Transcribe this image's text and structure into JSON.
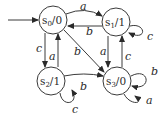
{
  "diagram": {
    "type": "finite-state-machine",
    "start_state": "s0",
    "states": [
      {
        "id": "s0",
        "name": "s",
        "sub": "0",
        "output": "/0",
        "cx": 53,
        "cy": 20
      },
      {
        "id": "s1",
        "name": "s",
        "sub": "1",
        "output": "/1",
        "cx": 116,
        "cy": 22
      },
      {
        "id": "s2",
        "name": "s",
        "sub": "2",
        "output": "/1",
        "cx": 51,
        "cy": 81
      },
      {
        "id": "s3",
        "name": "s",
        "sub": "3",
        "output": "/0",
        "cx": 117,
        "cy": 81
      }
    ],
    "transitions": [
      {
        "from": "s0",
        "to": "s1",
        "label": "a"
      },
      {
        "from": "s1",
        "to": "s0",
        "label": "b"
      },
      {
        "from": "s0",
        "to": "s2",
        "label": "c"
      },
      {
        "from": "s2",
        "to": "s0",
        "label": "a"
      },
      {
        "from": "s0",
        "to": "s3",
        "label": "b"
      },
      {
        "from": "s1",
        "to": "s1",
        "label": "c"
      },
      {
        "from": "s1",
        "to": "s3",
        "label": "a"
      },
      {
        "from": "s3",
        "to": "s1",
        "label": "c"
      },
      {
        "from": "s2",
        "to": "s2",
        "label": "c"
      },
      {
        "from": "s2",
        "to": "s3",
        "label": "b"
      },
      {
        "from": "s3",
        "to": "s3",
        "label": "b"
      },
      {
        "from": "s3",
        "to": "s3",
        "label": "a"
      }
    ],
    "colors": {
      "stroke": "#3a3a3a",
      "text": "#2a2a2a",
      "background": "#ffffff"
    }
  }
}
